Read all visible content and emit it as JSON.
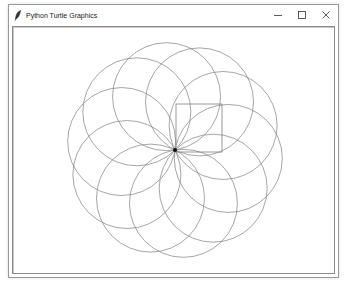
{
  "window": {
    "title": "Python Turtle Graphics",
    "icon": "feather-icon",
    "controls": [
      {
        "name": "minimize",
        "icon": "minimize-icon"
      },
      {
        "name": "maximize",
        "icon": "maximize-icon"
      },
      {
        "name": "close",
        "icon": "close-icon"
      }
    ]
  },
  "canvas": {
    "background": "#ffffff",
    "stroke_color": "#808080",
    "turtle_position": [
      175,
      150
    ],
    "circle_radius": 54,
    "circle_count": 10,
    "circle_center_angles_deg": [
      -99,
      -63,
      -27,
      9,
      45,
      81,
      117,
      153,
      189,
      225
    ],
    "square": {
      "x": 176,
      "y": 104,
      "width": 46,
      "height": 48
    }
  }
}
